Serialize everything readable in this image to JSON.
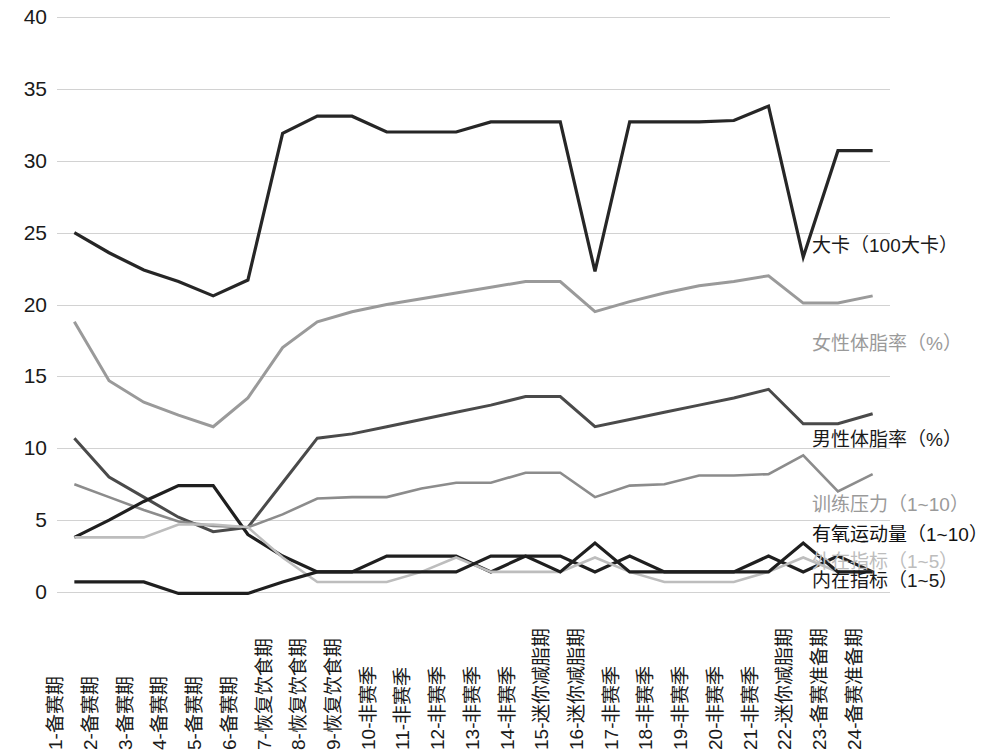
{
  "chart_data": {
    "type": "line",
    "title": "",
    "xlabel": "",
    "ylabel": "",
    "ylim": [
      0,
      40
    ],
    "ytick_step": 5,
    "yticks": [
      "0",
      "5",
      "10",
      "15",
      "20",
      "25",
      "30",
      "35",
      "40"
    ],
    "grid": true,
    "legend_position": "inline-right",
    "categories": [
      "1-备赛期",
      "2-备赛期",
      "3-备赛期",
      "4-备赛期",
      "5-备赛期",
      "6-备赛期",
      "7-恢复饮食期",
      "8-恢复饮食期",
      "9-恢复饮食期",
      "10-非赛季",
      "11-非赛季",
      "12-非赛季",
      "13-非赛季",
      "14-非赛季",
      "15-迷你减脂期",
      "16-迷你减脂期",
      "17-非赛季",
      "18-非赛季",
      "19-非赛季",
      "20-非赛季",
      "21-非赛季",
      "22-迷你减脂期",
      "23-备赛准备期",
      "24-备赛准备期"
    ],
    "series": [
      {
        "name": "大卡（100大卡）",
        "color": "#262626",
        "width": 3.2,
        "label_y": 24.0,
        "values": [
          25.0,
          23.6,
          22.4,
          21.6,
          20.6,
          21.7,
          31.9,
          33.1,
          33.1,
          32.0,
          32.0,
          32.0,
          32.7,
          32.7,
          32.7,
          22.3,
          32.7,
          32.7,
          32.7,
          32.8,
          33.8,
          23.3,
          30.7,
          30.7
        ]
      },
      {
        "name": "女性体脂率（%）",
        "color": "#9a9a9a",
        "width": 3.0,
        "label_y": 17.2,
        "values": [
          18.8,
          14.7,
          13.2,
          12.3,
          11.5,
          13.5,
          17.0,
          18.8,
          19.5,
          20.0,
          20.4,
          20.8,
          21.2,
          21.6,
          21.6,
          19.5,
          20.2,
          20.8,
          21.3,
          21.6,
          22.0,
          20.1,
          20.1,
          20.6
        ]
      },
      {
        "name": "男性体脂率（%）",
        "color": "#4a4a4a",
        "width": 3.0,
        "label_y": 10.5,
        "values": [
          10.7,
          8.0,
          6.6,
          5.2,
          4.2,
          4.5,
          7.6,
          10.7,
          11.0,
          11.5,
          12.0,
          12.5,
          13.0,
          13.6,
          13.6,
          11.5,
          12.0,
          12.5,
          13.0,
          13.5,
          14.1,
          11.7,
          11.7,
          12.4
        ]
      },
      {
        "name": "训练压力（1~10）",
        "color": "#8c8c8c",
        "width": 2.6,
        "label_y": 6.0,
        "values": [
          7.5,
          6.6,
          5.7,
          4.9,
          4.6,
          4.5,
          5.4,
          6.5,
          6.6,
          6.6,
          7.2,
          7.6,
          7.6,
          8.3,
          8.3,
          6.6,
          7.4,
          7.5,
          8.1,
          8.1,
          8.2,
          9.5,
          7.0,
          8.2
        ]
      },
      {
        "name": "有氧运动量（1~10）",
        "color": "#1f1f1f",
        "width": 3.2,
        "label_y": 3.9,
        "values": [
          3.8,
          5.0,
          6.3,
          7.4,
          7.4,
          4.0,
          2.5,
          1.4,
          1.4,
          2.5,
          2.5,
          2.5,
          1.4,
          2.5,
          2.5,
          1.4,
          2.5,
          1.4,
          1.4,
          1.4,
          2.5,
          1.4,
          2.5,
          1.4
        ]
      },
      {
        "name": "外在指标（1~5）",
        "color": "#bdbdbd",
        "width": 2.6,
        "label_y": 2.0,
        "values": [
          3.8,
          3.8,
          3.8,
          4.7,
          4.7,
          4.5,
          2.4,
          0.7,
          0.7,
          0.7,
          1.4,
          2.4,
          1.4,
          1.4,
          1.4,
          2.4,
          1.4,
          0.7,
          0.7,
          0.7,
          1.4,
          2.4,
          1.4,
          1.4
        ]
      },
      {
        "name": "内在指标（1~5）",
        "color": "#1f1f1f",
        "width": 3.2,
        "label_y": 0.7,
        "values": [
          0.7,
          0.7,
          0.7,
          -0.1,
          -0.1,
          -0.1,
          0.7,
          1.4,
          1.4,
          1.4,
          1.4,
          1.4,
          2.5,
          2.5,
          1.4,
          3.4,
          1.4,
          1.4,
          1.4,
          1.4,
          1.4,
          3.4,
          1.4,
          1.4
        ]
      }
    ],
    "annotations": [
      {
        "text": "大卡（100大卡）",
        "color": "#1a1a1a"
      },
      {
        "text": "女性体脂率（%）",
        "color": "#9a9a9a"
      },
      {
        "text": "男性体脂率（%）",
        "color": "#1a1a1a"
      },
      {
        "text": "训练压力（1~10）",
        "color": "#9a9a9a"
      },
      {
        "text": "有氧运动量（1~10）",
        "color": "#111111"
      },
      {
        "text": "外在指标（1~5）",
        "color": "#bdbdbd"
      },
      {
        "text": "内在指标（1~5）",
        "color": "#1a1a1a"
      }
    ]
  }
}
